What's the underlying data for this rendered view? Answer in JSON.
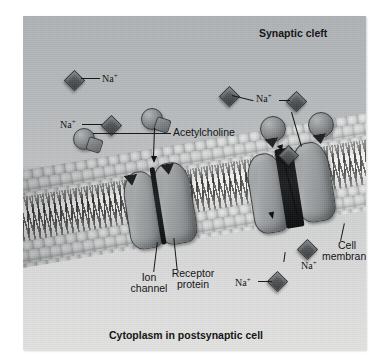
{
  "figure": {
    "title_region_top": "Synaptic cleft",
    "title_region_bottom": "Cytoplasm in postsynaptic cell",
    "background_top_color": "#b4b7ba",
    "background_bottom_color": "#dcdcdc"
  },
  "labels": {
    "synaptic_cleft": "Synaptic cleft",
    "cytoplasm": "Cytoplasm in postsynaptic cell",
    "acetylcholine": "Acetylcholine",
    "receptor_protein_line1": "Receptor",
    "receptor_protein_line2": "protein",
    "ion_channel_line1": "Ion",
    "ion_channel_line2": "channel",
    "cell_membrane_line1": "Cell",
    "cell_membrane_line2": "membrane",
    "sodium_ion": "Na",
    "sodium_charge": "+"
  },
  "ions": [
    {
      "id": "na-cleft-1",
      "label": "Na+",
      "region": "synaptic-cleft"
    },
    {
      "id": "na-cleft-2",
      "label": "Na+",
      "region": "synaptic-cleft"
    },
    {
      "id": "na-cleft-3",
      "label": "Na+",
      "region": "synaptic-cleft"
    },
    {
      "id": "na-cleft-4",
      "label": "Na+",
      "region": "synaptic-cleft"
    },
    {
      "id": "na-channel",
      "label": "",
      "region": "ion-channel"
    },
    {
      "id": "na-cyto-1",
      "label": "Na+",
      "region": "cytoplasm"
    },
    {
      "id": "na-cyto-2",
      "label": "Na+",
      "region": "cytoplasm"
    }
  ],
  "acetylcholine_molecules": [
    {
      "id": "ach-free-1",
      "state": "unbound"
    },
    {
      "id": "ach-bound-left",
      "state": "bound-closed-receptor"
    },
    {
      "id": "ach-bound-right-1",
      "state": "bound-open-receptor"
    },
    {
      "id": "ach-bound-right-2",
      "state": "bound-open-receptor"
    }
  ],
  "receptors": [
    {
      "id": "receptor-left",
      "state": "closed",
      "channel_open": false
    },
    {
      "id": "receptor-right",
      "state": "open",
      "channel_open": true
    }
  ]
}
